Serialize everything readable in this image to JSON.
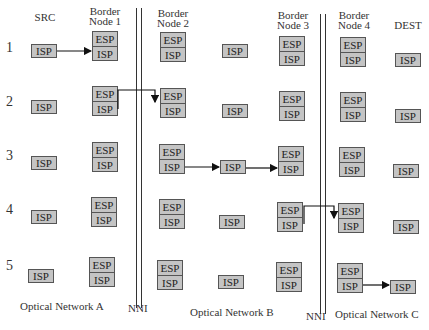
{
  "headers": {
    "src": "SRC",
    "bn1": [
      "Border",
      "Node 1"
    ],
    "bn2": [
      "Border",
      "Node 2"
    ],
    "bn3": [
      "Border",
      "Node 3"
    ],
    "bn4": [
      "Border",
      "Node 4"
    ],
    "dest": "DEST"
  },
  "rows": [
    "1",
    "2",
    "3",
    "4",
    "5"
  ],
  "labels": {
    "esp": "ESP",
    "isp": "ISP"
  },
  "footer": {
    "net_a": "Optical Network A",
    "nni1": "NNI",
    "net_b": "Optical Network B",
    "nni2": "NNI",
    "net_c": "Optical Network C"
  },
  "steps": [
    {
      "step": "1",
      "from": "SRC ISP",
      "to": "Border Node 1 ISP"
    },
    {
      "step": "2",
      "from": "Border Node 1 ISP",
      "to": "Border Node 2 ISP",
      "via": "NNI"
    },
    {
      "step": "3",
      "from": "Border Node 2 ISP",
      "to": "Border Node 3 ISP",
      "via": "Network B ISP"
    },
    {
      "step": "4",
      "from": "Border Node 3 ISP",
      "to": "Border Node 4 ISP",
      "via": "NNI"
    },
    {
      "step": "5",
      "from": "Border Node 4 ISP",
      "to": "DEST ISP"
    }
  ]
}
